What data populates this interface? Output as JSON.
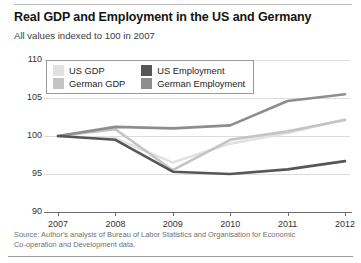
{
  "header": {
    "title": "Real GDP and Employment in the US and Germany",
    "subtitle": "All values indexed to 100 in 2007"
  },
  "source": {
    "line1": "Source: Author's analysis of Bureau of Labor Statistics and Organisation for Economic",
    "line2": "Co-operation and Development data."
  },
  "legend": {
    "items": [
      {
        "label": "US GDP",
        "color": "#e2e2e2"
      },
      {
        "label": "US Employment",
        "color": "#565656"
      },
      {
        "label": "German GDP",
        "color": "#c4c4c4"
      },
      {
        "label": "German Employment",
        "color": "#8d8d8d"
      }
    ]
  },
  "axis": {
    "y_ticks": [
      "110",
      "105",
      "100",
      "95",
      "90"
    ],
    "x_ticks": [
      "2007",
      "2008",
      "2009",
      "2010",
      "2011",
      "2012"
    ]
  },
  "chart_data": {
    "type": "line",
    "title": "Real GDP and Employment in the US and Germany",
    "subtitle": "All values indexed to 100 in 2007",
    "xlabel": "",
    "ylabel": "",
    "categories": [
      "2007",
      "2008",
      "2009",
      "2010",
      "2011",
      "2012"
    ],
    "ylim": [
      90,
      110
    ],
    "xlim": [
      "2007",
      "2012"
    ],
    "grid": true,
    "legend_position": "top-left-inside",
    "series": [
      {
        "name": "US GDP",
        "color": "#e2e2e2",
        "values": [
          100.0,
          99.7,
          96.5,
          99.0,
          100.4,
          102.2
        ]
      },
      {
        "name": "German GDP",
        "color": "#c4c4c4",
        "values": [
          100.0,
          100.9,
          95.5,
          99.5,
          100.6,
          102.1
        ]
      },
      {
        "name": "US Employment",
        "color": "#565656",
        "values": [
          100.0,
          99.5,
          95.3,
          95.0,
          95.6,
          96.7
        ]
      },
      {
        "name": "German Employment",
        "color": "#8d8d8d",
        "values": [
          100.0,
          101.2,
          101.0,
          101.4,
          104.6,
          105.5
        ]
      }
    ],
    "annotations": [
      "All values indexed to 100 in 2007",
      "Source: Author's analysis of Bureau of Labor Statistics and Organisation for Economic Co-operation and Development data."
    ]
  }
}
